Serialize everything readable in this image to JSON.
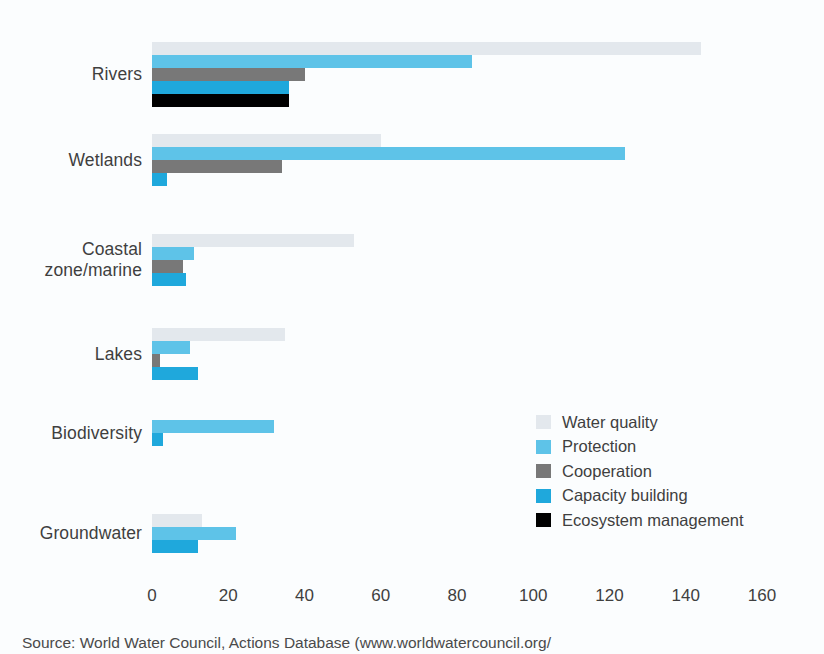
{
  "chart_data": {
    "type": "bar",
    "orientation": "horizontal",
    "title": "",
    "xlabel": "",
    "ylabel": "",
    "xlim": [
      0,
      160
    ],
    "xticks": [
      0,
      20,
      40,
      60,
      80,
      100,
      120,
      140,
      160
    ],
    "grid": false,
    "legend_position": "middle-right",
    "categories": [
      "Rivers",
      "Coastal zone/marine",
      "Wetlands",
      "Lakes",
      "Biodiversity",
      "Groundwater"
    ],
    "category_labels": [
      {
        "line1": "Rivers",
        "line2": ""
      },
      {
        "line1": "Wetlands",
        "line2": ""
      },
      {
        "line1": "Coastal",
        "line2": "zone/marine"
      },
      {
        "line1": "Lakes",
        "line2": ""
      },
      {
        "line1": "Biodiversity",
        "line2": ""
      },
      {
        "line1": "Groundwater",
        "line2": ""
      }
    ],
    "series": [
      {
        "name": "Water quality",
        "color": "#e3e8ed",
        "values": [
          144,
          60,
          53,
          35,
          0,
          13
        ]
      },
      {
        "name": "Protection",
        "color": "#5ec3e8",
        "values": [
          84,
          124,
          11,
          10,
          32,
          22
        ]
      },
      {
        "name": "Cooperation",
        "color": "#787878",
        "values": [
          40,
          34,
          8,
          2,
          0,
          0
        ]
      },
      {
        "name": "Capacity building",
        "color": "#1fa8dc",
        "values": [
          36,
          4,
          9,
          12,
          3,
          12
        ]
      },
      {
        "name": "Ecosystem management",
        "color": "#000000",
        "values": [
          36,
          0,
          0,
          0,
          0,
          0
        ]
      }
    ],
    "series_order_in_group": [
      "Water quality",
      "Protection",
      "Cooperation",
      "Capacity building",
      "Ecosystem management"
    ]
  },
  "legend": {
    "items": [
      {
        "label": "Water quality",
        "color": "#e3e8ed"
      },
      {
        "label": "Protection",
        "color": "#5ec3e8"
      },
      {
        "label": "Cooperation",
        "color": "#787878"
      },
      {
        "label": "Capacity building",
        "color": "#1fa8dc"
      },
      {
        "label": "Ecosystem management",
        "color": "#000000"
      }
    ]
  },
  "axis": {
    "xticks": [
      "0",
      "20",
      "40",
      "60",
      "80",
      "100",
      "120",
      "140",
      "160"
    ]
  },
  "source": {
    "text": "Source: World Water Council, Actions Database (www.worldwatercouncil.org/"
  }
}
